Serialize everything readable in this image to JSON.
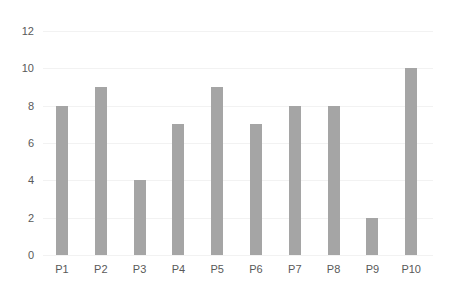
{
  "chart_data": {
    "type": "bar",
    "title": "",
    "xlabel": "",
    "ylabel": "",
    "categories": [
      "P1",
      "P2",
      "P3",
      "P4",
      "P5",
      "P6",
      "P7",
      "P8",
      "P9",
      "P10"
    ],
    "values": [
      8,
      9,
      4,
      7,
      9,
      7,
      8,
      8,
      2,
      10
    ],
    "ylim": [
      0,
      12
    ],
    "yticks": [
      0,
      2,
      4,
      6,
      8,
      10,
      12
    ],
    "grid": true,
    "legend": null,
    "bar_color": "#a5a5a5"
  }
}
